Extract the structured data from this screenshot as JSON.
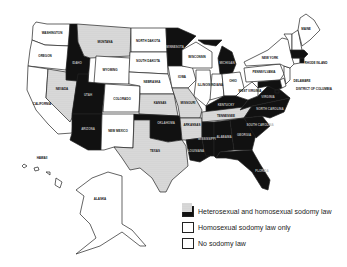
{
  "colors": {
    "both": "#111111",
    "homosexual_only": "#d8d8d8",
    "none": "#ffffff",
    "stroke": "#222222"
  },
  "legend": {
    "items": [
      {
        "key": "both",
        "label": "Heterosexual and homosexual sodomy law"
      },
      {
        "key": "homosexual_only",
        "label": "Homosexual sodomy law only"
      },
      {
        "key": "none",
        "label": "No sodomy law"
      }
    ]
  },
  "states": {
    "WA": {
      "name": "WASHINGTON",
      "status": "none"
    },
    "OR": {
      "name": "OREGON",
      "status": "none"
    },
    "CA": {
      "name": "CALIFORNIA",
      "status": "none"
    },
    "NV": {
      "name": "NEVADA",
      "status": "homosexual_only"
    },
    "ID": {
      "name": "IDAHO",
      "status": "both"
    },
    "MT": {
      "name": "MONTANA",
      "status": "homosexual_only"
    },
    "WY": {
      "name": "WYOMING",
      "status": "none"
    },
    "UT": {
      "name": "UTAH",
      "status": "both"
    },
    "AZ": {
      "name": "ARIZONA",
      "status": "both"
    },
    "CO": {
      "name": "COLORADO",
      "status": "none"
    },
    "NM": {
      "name": "NEW MEXICO",
      "status": "none"
    },
    "ND": {
      "name": "NORTH DAKOTA",
      "status": "none"
    },
    "SD": {
      "name": "SOUTH DAKOTA",
      "status": "none"
    },
    "NE": {
      "name": "NEBRASKA",
      "status": "none"
    },
    "KS": {
      "name": "KANSAS",
      "status": "homosexual_only"
    },
    "OK": {
      "name": "OKLAHOMA",
      "status": "both"
    },
    "TX": {
      "name": "TEXAS",
      "status": "homosexual_only"
    },
    "MN": {
      "name": "MINNESOTA",
      "status": "both"
    },
    "IA": {
      "name": "IOWA",
      "status": "none"
    },
    "MO": {
      "name": "MISSOURI",
      "status": "homosexual_only"
    },
    "AR": {
      "name": "ARKANSAS",
      "status": "homosexual_only"
    },
    "LA": {
      "name": "LOUISIANA",
      "status": "both"
    },
    "WI": {
      "name": "WISCONSIN",
      "status": "none"
    },
    "IL": {
      "name": "ILLINOIS",
      "status": "none"
    },
    "MI": {
      "name": "MICHIGAN",
      "status": "both"
    },
    "IN": {
      "name": "INDIANA",
      "status": "none"
    },
    "OH": {
      "name": "OHIO",
      "status": "none"
    },
    "KY": {
      "name": "KENTUCKY",
      "status": "both"
    },
    "TN": {
      "name": "TENNESSEE",
      "status": "homosexual_only"
    },
    "MS": {
      "name": "MISSISSIPPI",
      "status": "both"
    },
    "AL": {
      "name": "ALABAMA",
      "status": "both"
    },
    "GA": {
      "name": "GEORGIA",
      "status": "both"
    },
    "FL": {
      "name": "FLORIDA",
      "status": "both"
    },
    "SC": {
      "name": "SOUTH CAROLINA",
      "status": "both"
    },
    "NC": {
      "name": "NORTH CAROLINA",
      "status": "both"
    },
    "VA": {
      "name": "VIRGINIA",
      "status": "both"
    },
    "WV": {
      "name": "WEST VIRGINIA",
      "status": "none"
    },
    "PA": {
      "name": "PENNSYLVANIA",
      "status": "none"
    },
    "NY": {
      "name": "NEW YORK",
      "status": "none"
    },
    "NJ": {
      "name": "NEW JERSEY",
      "status": "none"
    },
    "DE": {
      "name": "DELAWARE",
      "status": "none"
    },
    "MD": {
      "name": "MARYLAND",
      "status": "both"
    },
    "DC": {
      "name": "DISTRICT OF COLUMBIA",
      "status": "both"
    },
    "CT": {
      "name": "CONNECTICUT",
      "status": "none"
    },
    "RI": {
      "name": "RHODE ISLAND",
      "status": "both"
    },
    "MA": {
      "name": "MASSACHUSETTS",
      "status": "both"
    },
    "VT": {
      "name": "VERMONT",
      "status": "none"
    },
    "NH": {
      "name": "NEW HAMPSHIRE",
      "status": "none"
    },
    "ME": {
      "name": "MAINE",
      "status": "none"
    },
    "AK": {
      "name": "ALASKA",
      "status": "none"
    },
    "HI": {
      "name": "HAWAII",
      "status": "none"
    }
  }
}
